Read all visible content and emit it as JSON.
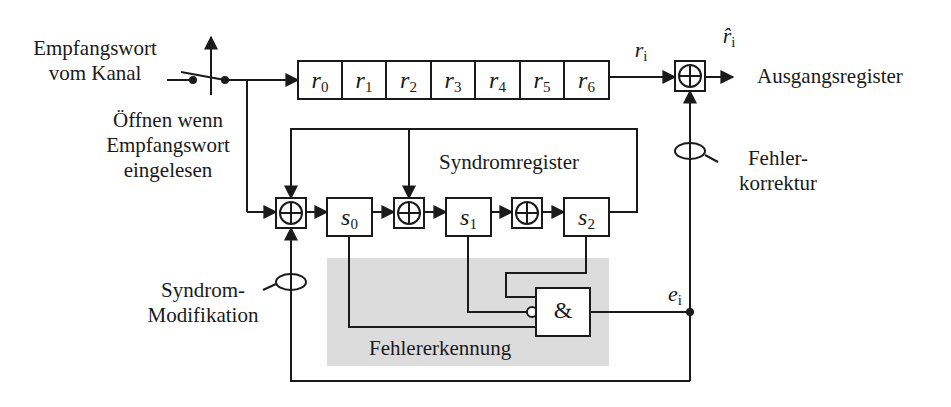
{
  "diagram": {
    "input_label": [
      "Empfangswort",
      "vom Kanal"
    ],
    "switch_label": [
      "Öffnen wenn",
      "Empfangswort",
      "eingelesen"
    ],
    "receive_register": {
      "cells": [
        {
          "sym": "r",
          "sub": "0"
        },
        {
          "sym": "r",
          "sub": "1"
        },
        {
          "sym": "r",
          "sub": "2"
        },
        {
          "sym": "r",
          "sub": "3"
        },
        {
          "sym": "r",
          "sub": "4"
        },
        {
          "sym": "r",
          "sub": "5"
        },
        {
          "sym": "r",
          "sub": "6"
        }
      ]
    },
    "signal_ri": {
      "sym": "r",
      "sub": "i"
    },
    "signal_ri_hat": {
      "sym": "r̂",
      "sub": "i"
    },
    "output_label": "Ausgangsregister",
    "correction_label": [
      "Fehler-",
      "korrektur"
    ],
    "syndrome_register_label": "Syndromregister",
    "syndrome_cells": [
      {
        "sym": "s",
        "sub": "0"
      },
      {
        "sym": "s",
        "sub": "1"
      },
      {
        "sym": "s",
        "sub": "2"
      }
    ],
    "xor_symbol": "⊕",
    "and_gate_label": "&",
    "signal_ei": {
      "sym": "e",
      "sub": "i"
    },
    "error_detection_label": "Fehlererkennung",
    "syndrome_mod_label": [
      "Syndrom-",
      "Modifikation"
    ],
    "colors": {
      "line": "#1a1a1a",
      "detection_area": "#d9d9d9",
      "background": "#ffffff"
    }
  }
}
